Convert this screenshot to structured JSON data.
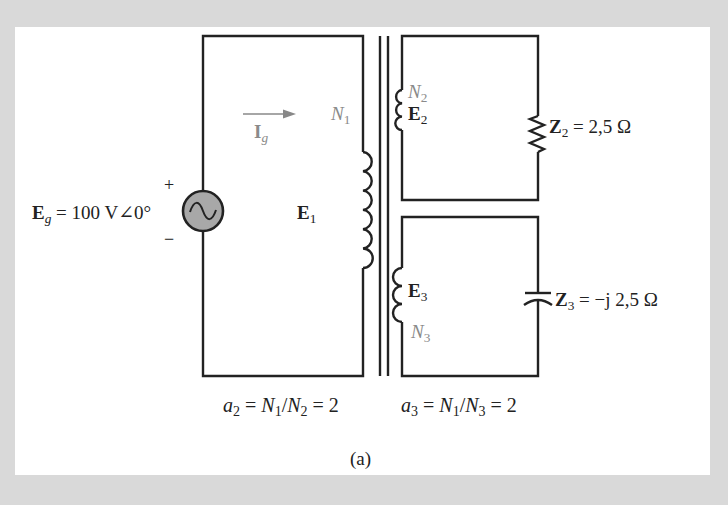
{
  "figure": {
    "caption": "(a)",
    "colors": {
      "background": "#d9d9d9",
      "panel": "#ffffff",
      "wire": "#222222",
      "source_fill": "#a8a8a8",
      "label_gray": "#8a8a8a"
    }
  },
  "source": {
    "symbol": "E",
    "subscript": "g",
    "value_text": "= 100 V∠0°",
    "plus": "+",
    "minus": "−",
    "icon": "ac-voltage-source-icon"
  },
  "current": {
    "symbol": "I",
    "subscript": "g",
    "icon": "arrow-right-icon"
  },
  "primary": {
    "turns_symbol": "N",
    "turns_subscript": "1",
    "emf_symbol": "E",
    "emf_subscript": "1"
  },
  "secondary_2": {
    "turns_symbol": "N",
    "turns_subscript": "2",
    "emf_symbol": "E",
    "emf_subscript": "2",
    "load_symbol": "Z",
    "load_subscript": "2",
    "load_value": "= 2,5 Ω",
    "load_icon": "resistor-icon"
  },
  "secondary_3": {
    "turns_symbol": "N",
    "turns_subscript": "3",
    "emf_symbol": "E",
    "emf_subscript": "3",
    "load_symbol": "Z",
    "load_subscript": "3",
    "load_value": "= −j 2,5 Ω",
    "load_icon": "capacitor-icon"
  },
  "ratios": {
    "a2": {
      "a": "a",
      "a_sub": "2",
      "eq1": " = ",
      "n_num": "N",
      "n_num_sub": "1",
      "slash": "/",
      "n_den": "N",
      "n_den_sub": "2",
      "eq2": " = 2"
    },
    "a3": {
      "a": "a",
      "a_sub": "3",
      "eq1": " = ",
      "n_num": "N",
      "n_num_sub": "1",
      "slash": "/",
      "n_den": "N",
      "n_den_sub": "3",
      "eq2": " = 2"
    }
  }
}
